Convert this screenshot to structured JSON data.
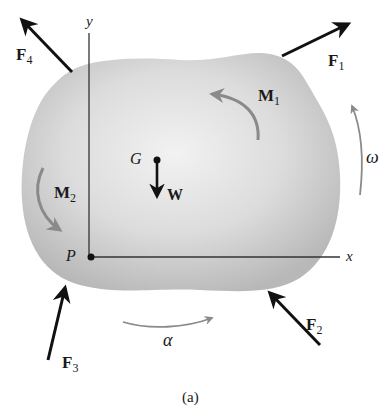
{
  "figure": {
    "caption": "(a)",
    "colors": {
      "body_fill_center": "#f0f0f0",
      "body_fill_edge": "#bdbdbd",
      "force_arrow": "#111111",
      "moment_arrow": "#8a8a8a",
      "axis": "#333333",
      "background": "#ffffff"
    },
    "axes": {
      "x_label": "x",
      "y_label": "y",
      "origin_label": "P"
    },
    "center_of_gravity": {
      "label": "G",
      "weight_label": "W"
    },
    "forces": [
      {
        "id": "F1",
        "main": "F",
        "sub": "1"
      },
      {
        "id": "F2",
        "main": "F",
        "sub": "2"
      },
      {
        "id": "F3",
        "main": "F",
        "sub": "3"
      },
      {
        "id": "F4",
        "main": "F",
        "sub": "4"
      }
    ],
    "moments": [
      {
        "id": "M1",
        "main": "M",
        "sub": "1",
        "direction": "counterclockwise"
      },
      {
        "id": "M2",
        "main": "M",
        "sub": "2",
        "direction": "counterclockwise"
      }
    ],
    "kinematics": {
      "angular_velocity_label": "ω",
      "angular_acceleration_label": "α"
    }
  }
}
